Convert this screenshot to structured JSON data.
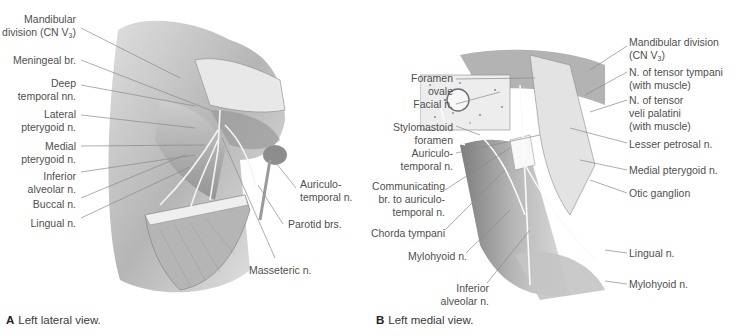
{
  "panels": [
    {
      "id": "A",
      "caption_letter": "A",
      "caption_text": "Left lateral view.",
      "labels": [
        {
          "text_lines": [
            "Mandibular",
            "division (CN V3)"
          ]
        },
        {
          "text_lines": [
            "Meningeal br."
          ]
        },
        {
          "text_lines": [
            "Deep",
            "temporal nn."
          ]
        },
        {
          "text_lines": [
            "Lateral",
            "pterygoid n."
          ]
        },
        {
          "text_lines": [
            "Medial",
            "pterygoid n."
          ]
        },
        {
          "text_lines": [
            "Inferior",
            "alveolar n."
          ]
        },
        {
          "text_lines": [
            "Buccal n."
          ]
        },
        {
          "text_lines": [
            "Lingual n."
          ]
        },
        {
          "text_lines": [
            "Auriculo-",
            "temporal n."
          ]
        },
        {
          "text_lines": [
            "Parotid brs."
          ]
        },
        {
          "text_lines": [
            "Masseteric n."
          ]
        }
      ]
    },
    {
      "id": "B",
      "caption_letter": "B",
      "caption_text": "Left medial view.",
      "labels": [
        {
          "text_lines": [
            "Foramen",
            "ovale"
          ]
        },
        {
          "text_lines": [
            "Facial n."
          ]
        },
        {
          "text_lines": [
            "Stylomastoid",
            "foramen"
          ]
        },
        {
          "text_lines": [
            "Auriculo-",
            "temporal n."
          ]
        },
        {
          "text_lines": [
            "Communicating",
            "br. to auriculo-",
            "temporal n."
          ]
        },
        {
          "text_lines": [
            "Chorda tympani"
          ]
        },
        {
          "text_lines": [
            "Mylohyoid n."
          ]
        },
        {
          "text_lines": [
            "Inferior",
            "alveolar n."
          ]
        },
        {
          "text_lines": [
            "Mandibular division",
            "(CN V3)"
          ]
        },
        {
          "text_lines": [
            "N. of tensor tympani",
            "(with muscle)"
          ]
        },
        {
          "text_lines": [
            "N. of tensor",
            "veli palatini",
            "(with muscle)"
          ]
        },
        {
          "text_lines": [
            "Lesser petrosal n."
          ]
        },
        {
          "text_lines": [
            "Medial pterygoid n."
          ]
        },
        {
          "text_lines": [
            "Otic ganglion"
          ]
        },
        {
          "text_lines": [
            "Lingual n."
          ]
        },
        {
          "text_lines": [
            "Mylohyoid n."
          ]
        }
      ]
    }
  ],
  "text": {
    "a_l0_1": "Mandibular",
    "a_l0_2a": "division (CN V",
    "a_l0_sub": "3",
    "a_l0_2b": ")",
    "a_l1": "Meningeal br.",
    "a_l2_1": "Deep",
    "a_l2_2": "temporal nn.",
    "a_l3_1": "Lateral",
    "a_l3_2": "pterygoid n.",
    "a_l4_1": "Medial",
    "a_l4_2": "pterygoid n.",
    "a_l5_1": "Inferior",
    "a_l5_2": "alveolar n.",
    "a_l6": "Buccal n.",
    "a_l7": "Lingual n.",
    "a_l8_1": "Auriculo-",
    "a_l8_2": "temporal n.",
    "a_l9": "Parotid brs.",
    "a_l10": "Masseteric n.",
    "a_cap_letter": "A",
    "a_cap_text": "Left lateral view.",
    "b_l0_1": "Foramen",
    "b_l0_2": "ovale",
    "b_l1": "Facial n.",
    "b_l2_1": "Stylomastoid",
    "b_l2_2": "foramen",
    "b_l3_1": "Auriculo-",
    "b_l3_2": "temporal n.",
    "b_l4_1": "Communicating",
    "b_l4_2": "br. to auriculo-",
    "b_l4_3": "temporal n.",
    "b_l5": "Chorda tympani",
    "b_l6": "Mylohyoid n.",
    "b_l7_1": "Inferior",
    "b_l7_2": "alveolar n.",
    "b_r0_1": "Mandibular division",
    "b_r0_2a": "(CN V",
    "b_r0_sub": "3",
    "b_r0_2b": ")",
    "b_r1_1": "N. of tensor tympani",
    "b_r1_2": "(with muscle)",
    "b_r2_1": "N. of tensor",
    "b_r2_2": "veli palatini",
    "b_r2_3": "(with muscle)",
    "b_r3": "Lesser petrosal n.",
    "b_r4": "Medial pterygoid n.",
    "b_r5": "Otic ganglion",
    "b_r6": "Lingual n.",
    "b_r7": "Mylohyoid n.",
    "b_cap_letter": "B",
    "b_cap_text": "Left medial view."
  },
  "colors": {
    "label_text": "#4f4f4f",
    "leader_line": "#8a8a8a",
    "illustration_light": "#e6e6e6",
    "illustration_mid": "#bdbdbd",
    "illustration_dark": "#6e6e6e"
  }
}
